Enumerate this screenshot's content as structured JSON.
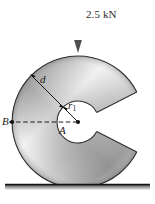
{
  "figure": {
    "type": "engineering-mechanics-diagram",
    "width": 155,
    "height": 204,
    "background_color": "#ffffff"
  },
  "load": {
    "label": "2.5 kN",
    "value": 2.5,
    "unit": "kN",
    "direction": "down",
    "arrow_color": "#5a5a5a",
    "arrow": {
      "x": 78,
      "y_start": 8,
      "y_end": 52
    },
    "label_position": {
      "x": 86,
      "y": 9
    }
  },
  "disk": {
    "name": "c-shaped-disk",
    "center": {
      "x": 78,
      "y": 122
    },
    "outer_radius": 66,
    "hole_radius": 21,
    "notch_half_angle_deg": 27,
    "notch_direction_deg": 0,
    "edge_color": "#333333",
    "fill_light": "#efefef",
    "fill_mid": "#b9b9b9",
    "fill_dark": "#8e8e8e",
    "hole_fill": "#ffffff"
  },
  "dimensions": {
    "d": {
      "label": "d",
      "description": "radial thickness from outer edge to hole edge",
      "label_position": {
        "x": 40,
        "y": 74
      },
      "from": {
        "x": 31.3,
        "y": 75.3
      },
      "to": {
        "x": 63.2,
        "y": 107.2
      }
    },
    "r1": {
      "label": "r",
      "subscript": "1",
      "description": "hole radius measured from center A",
      "label_position": {
        "x": 68,
        "y": 100
      },
      "from": {
        "x": 78,
        "y": 122
      },
      "to": {
        "x": 63.2,
        "y": 107.2
      }
    }
  },
  "points": {
    "A": {
      "label": "A",
      "description": "disk center",
      "position": {
        "x": 78,
        "y": 122
      },
      "label_position": {
        "x": 59,
        "y": 125
      }
    },
    "B": {
      "label": "B",
      "description": "point on outer edge at left, on horizontal through A",
      "position": {
        "x": 12,
        "y": 122
      },
      "label_position": {
        "x": 2,
        "y": 116
      }
    }
  },
  "dashed_line": {
    "name": "centerline-B-to-A",
    "from": {
      "x": 9,
      "y": 122
    },
    "to": {
      "x": 78,
      "y": 122
    },
    "style": "dashed",
    "color": "#1a1a1a"
  },
  "ground": {
    "name": "ground-line",
    "y_top": 184,
    "y_bottom": 190,
    "x_start": 5,
    "x_end": 150,
    "top_color": "#2e2e2e",
    "bottom_color": "#d0d0d0"
  }
}
